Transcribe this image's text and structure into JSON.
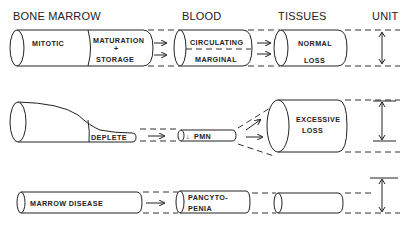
{
  "headers": {
    "bone_marrow": "BONE MARROW",
    "blood": "BLOOD",
    "tissues": "TISSUES",
    "unit": "UNIT"
  },
  "rows": [
    {
      "name": "normal",
      "marrow": {
        "left": "MITOTIC",
        "right_line1": "MATURATION",
        "right_line2": "+",
        "right_line3": "STORAGE"
      },
      "blood": {
        "top": "CIRCULATING",
        "bottom": "MARGINAL"
      },
      "tissues": {
        "line1": "NORMAL",
        "line2": "LOSS"
      }
    },
    {
      "name": "excessive-loss",
      "marrow": {
        "label": "DEPLETE"
      },
      "blood": {
        "arrow": "↓",
        "label": "PMN"
      },
      "tissues": {
        "line1": "EXCESSIVE",
        "line2": "LOSS"
      }
    },
    {
      "name": "marrow-disease",
      "marrow": {
        "label": "MARROW DISEASE"
      },
      "blood": {
        "line1": "PANCYTO-",
        "line2": "PENIA"
      },
      "tissues": {}
    }
  ]
}
